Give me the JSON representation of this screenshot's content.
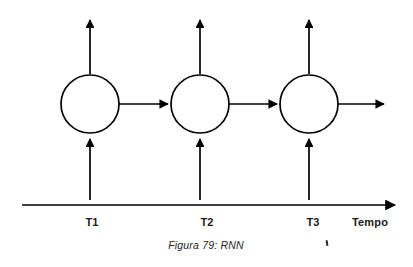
{
  "figure": {
    "caption": "Figura 79: RNN",
    "background_color": "#ffffff",
    "stroke_color": "#000000"
  },
  "axis": {
    "name": "time-axis",
    "label": "Tempo",
    "label_x": 370,
    "y": 205,
    "x_start": 22,
    "x_end": 398,
    "ticks": [
      {
        "label": "T1",
        "x": 92
      },
      {
        "label": "T2",
        "x": 207
      },
      {
        "label": "T3",
        "x": 313
      }
    ]
  },
  "nodes": [
    {
      "id": "t1",
      "label": "",
      "cx": 90,
      "cy": 104,
      "r": 29,
      "time": "T1"
    },
    {
      "id": "t2",
      "label": "",
      "cx": 200,
      "cy": 104,
      "r": 29,
      "time": "T2"
    },
    {
      "id": "t3",
      "label": "",
      "cx": 309,
      "cy": 104,
      "r": 29,
      "time": "T3"
    }
  ],
  "arrows": {
    "inputs": [
      {
        "node": "t1",
        "from_y": 200,
        "to_y": 137,
        "x": 90
      },
      {
        "node": "t2",
        "from_y": 200,
        "to_y": 137,
        "x": 200
      },
      {
        "node": "t3",
        "from_y": 200,
        "to_y": 137,
        "x": 309
      }
    ],
    "outputs": [
      {
        "node": "t1",
        "from_y": 73,
        "to_y": 18,
        "x": 90
      },
      {
        "node": "t2",
        "from_y": 73,
        "to_y": 18,
        "x": 200
      },
      {
        "node": "t3",
        "from_y": 73,
        "to_y": 18,
        "x": 309
      }
    ],
    "recurrent": [
      {
        "from": "t1",
        "to": "t2",
        "x_start": 120,
        "x_end": 170,
        "y": 104
      },
      {
        "from": "t2",
        "to": "t3",
        "x_start": 230,
        "x_end": 279,
        "y": 104
      },
      {
        "from": "t3",
        "to": "out",
        "x_start": 339,
        "x_end": 386,
        "y": 104
      }
    ]
  },
  "stray_mark": {
    "name": "ocr-artifact-mark",
    "x": 326,
    "y": 240
  }
}
